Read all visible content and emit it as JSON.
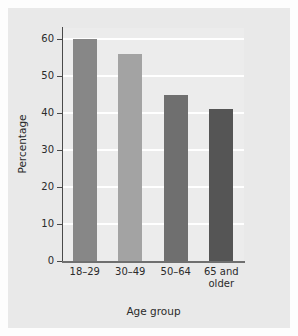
{
  "chart_data": {
    "type": "bar",
    "title": "",
    "categories": [
      "18–29",
      "30–49",
      "50–64",
      "65 and\nolder"
    ],
    "values": [
      60,
      56,
      45,
      41
    ],
    "series": [
      {
        "name": "Percentage",
        "values": [
          60,
          56,
          45,
          41
        ]
      }
    ],
    "xlabel": "Age group",
    "ylabel": "Percentage",
    "ylim": [
      0,
      63
    ],
    "yticks": [
      0,
      10,
      20,
      30,
      40,
      50,
      60
    ],
    "ytick_labels": [
      "0",
      "10",
      "20",
      "30",
      "40",
      "50",
      "60"
    ],
    "grid": true,
    "gridline_color": "#ffffff",
    "legend": "none",
    "bar_colors": [
      "#878787",
      "#a3a3a3",
      "#6f6f6f",
      "#555555"
    ],
    "plot_background": "#ececec",
    "panel_background": "#e9e9e9",
    "axis_color": "#4a4a4a"
  }
}
